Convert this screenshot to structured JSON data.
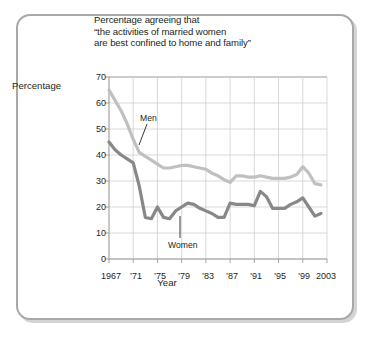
{
  "chart_data": {
    "type": "line",
    "title": "Percentage agreeing that\n“the activities of married women\nare best confined to home and family”",
    "xlabel": "Year",
    "ylabel": "Percentage",
    "xlim": [
      1967,
      2003
    ],
    "ylim": [
      0,
      70
    ],
    "grid": true,
    "legend": "inline-annotations",
    "xticks": [
      1967,
      1971,
      1975,
      1979,
      1983,
      1987,
      1991,
      1995,
      1999,
      2003
    ],
    "xticklabels": [
      "1967",
      "’71",
      "’75",
      "’79",
      "’83",
      "’87",
      "’91",
      "’95",
      "’99",
      "2003"
    ],
    "yticks": [
      0,
      10,
      20,
      30,
      40,
      50,
      60,
      70
    ],
    "yticklabels": [
      "0",
      "10",
      "20",
      "30",
      "40",
      "50",
      "60",
      "70"
    ],
    "x": [
      1967,
      1968,
      1969,
      1970,
      1971,
      1972,
      1973,
      1974,
      1975,
      1976,
      1977,
      1978,
      1979,
      1980,
      1981,
      1982,
      1983,
      1984,
      1985,
      1986,
      1987,
      1988,
      1989,
      1990,
      1991,
      1992,
      1993,
      1994,
      1995,
      1996,
      1997,
      1998,
      1999,
      2000,
      2001,
      2002
    ],
    "series": [
      {
        "name": "Men",
        "color": "#c0c0c0",
        "values": [
          65,
          61,
          57,
          52,
          46,
          41,
          39.5,
          38,
          36.5,
          35,
          35,
          35.5,
          36,
          36,
          35.5,
          35,
          34.5,
          33,
          32,
          30.5,
          29.5,
          32,
          32,
          31.5,
          31.5,
          32,
          31.5,
          31,
          31,
          31,
          31.5,
          32.5,
          35.5,
          33,
          29,
          28.5
        ]
      },
      {
        "name": "Women",
        "color": "#888888",
        "values": [
          45,
          42,
          40,
          38.5,
          37,
          28,
          16,
          15.5,
          20,
          16,
          15.5,
          18.5,
          20,
          21.5,
          21,
          19.5,
          18.5,
          17.5,
          16,
          16,
          21.5,
          21,
          21,
          21,
          20.5,
          26,
          24,
          19.5,
          19.5,
          19.5,
          21,
          22,
          23.5,
          20,
          16.5,
          17.5
        ]
      }
    ],
    "annotations": [
      {
        "text": "Men",
        "series": "Men"
      },
      {
        "text": "Women",
        "series": "Women"
      }
    ]
  }
}
